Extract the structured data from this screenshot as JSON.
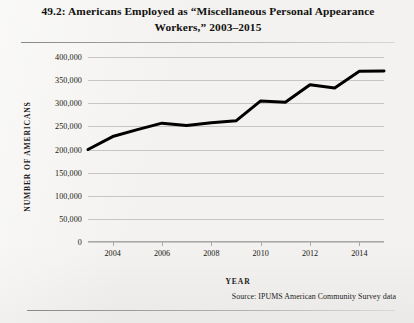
{
  "figure": {
    "title": "49.2: Americans Employed as “Miscellaneous Personal Appearance Workers,” 2003–2015",
    "source": "Source:  IPUMS American Community Survey data"
  },
  "chart_data": {
    "type": "line",
    "title": "49.2: Americans Employed as “Miscellaneous Personal Appearance Workers,” 2003–2015",
    "xlabel": "YEAR",
    "ylabel": "NUMBER OF AMERICANS",
    "x": [
      2003,
      2004,
      2005,
      2006,
      2007,
      2008,
      2009,
      2010,
      2011,
      2012,
      2013,
      2014,
      2015
    ],
    "values": [
      200000,
      228000,
      243000,
      257000,
      252000,
      258000,
      262000,
      305000,
      302000,
      340000,
      333000,
      369000,
      370000
    ],
    "series": [
      {
        "name": "Miscellaneous Personal Appearance Workers",
        "values": [
          200000,
          228000,
          243000,
          257000,
          252000,
          258000,
          262000,
          305000,
          302000,
          340000,
          333000,
          369000,
          370000
        ]
      }
    ],
    "xlim": [
      2003,
      2015
    ],
    "ylim": [
      0,
      400000
    ],
    "ytick_values": [
      0,
      50000,
      100000,
      150000,
      200000,
      250000,
      300000,
      350000,
      400000
    ],
    "ytick_labels": [
      "0",
      "50,000",
      "100,000",
      "150,000",
      "200,000",
      "250,000",
      "300,000",
      "350,000",
      "400,000"
    ],
    "xtick_values": [
      2004,
      2006,
      2008,
      2010,
      2012,
      2014
    ],
    "xtick_labels": [
      "2004",
      "2006",
      "2008",
      "2010",
      "2012",
      "2014"
    ],
    "grid": "horizontal",
    "legend": "none",
    "line_color": "#000000",
    "grid_color": "#c7c6c2",
    "background_color": "#f3f2f0"
  }
}
